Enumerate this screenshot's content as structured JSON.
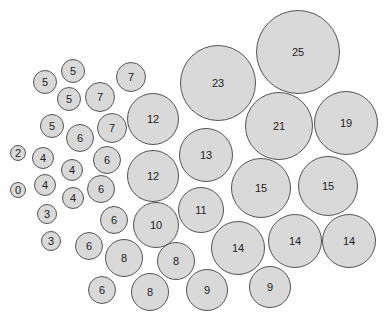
{
  "chart_data": {
    "type": "bubble",
    "title": "",
    "xlabel": "",
    "ylabel": "",
    "grid": false,
    "legend": null,
    "fill_color": "#d9d9d9",
    "stroke_color": "#555555",
    "text_color": "#222222",
    "bubbles": [
      {
        "label": "25",
        "value": 25,
        "cx": 298,
        "cy": 52,
        "r": 42
      },
      {
        "label": "23",
        "value": 23,
        "cx": 218,
        "cy": 83,
        "r": 38
      },
      {
        "label": "21",
        "value": 21,
        "cx": 279,
        "cy": 126,
        "r": 34
      },
      {
        "label": "19",
        "value": 19,
        "cx": 346,
        "cy": 123,
        "r": 32
      },
      {
        "label": "12",
        "value": 12,
        "cx": 153,
        "cy": 119,
        "r": 26
      },
      {
        "label": "13",
        "value": 13,
        "cx": 206,
        "cy": 155,
        "r": 27
      },
      {
        "label": "12",
        "value": 12,
        "cx": 153,
        "cy": 176,
        "r": 26
      },
      {
        "label": "15",
        "value": 15,
        "cx": 261,
        "cy": 188,
        "r": 30
      },
      {
        "label": "15",
        "value": 15,
        "cx": 328,
        "cy": 186,
        "r": 30
      },
      {
        "label": "11",
        "value": 11,
        "cx": 201,
        "cy": 210,
        "r": 23
      },
      {
        "label": "10",
        "value": 10,
        "cx": 156,
        "cy": 225,
        "r": 23
      },
      {
        "label": "14",
        "value": 14,
        "cx": 238,
        "cy": 248,
        "r": 27
      },
      {
        "label": "14",
        "value": 14,
        "cx": 295,
        "cy": 241,
        "r": 27
      },
      {
        "label": "14",
        "value": 14,
        "cx": 349,
        "cy": 241,
        "r": 27
      },
      {
        "label": "8",
        "value": 8,
        "cx": 176,
        "cy": 261,
        "r": 19
      },
      {
        "label": "9",
        "value": 9,
        "cx": 207,
        "cy": 290,
        "r": 21
      },
      {
        "label": "9",
        "value": 9,
        "cx": 270,
        "cy": 287,
        "r": 21
      },
      {
        "label": "8",
        "value": 8,
        "cx": 150,
        "cy": 292,
        "r": 19
      },
      {
        "label": "8",
        "value": 8,
        "cx": 124,
        "cy": 258,
        "r": 19
      },
      {
        "label": "6",
        "value": 6,
        "cx": 102,
        "cy": 290,
        "r": 14
      },
      {
        "label": "6",
        "value": 6,
        "cx": 89,
        "cy": 246,
        "r": 14
      },
      {
        "label": "6",
        "value": 6,
        "cx": 114,
        "cy": 220,
        "r": 14
      },
      {
        "label": "6",
        "value": 6,
        "cx": 101,
        "cy": 189,
        "r": 14
      },
      {
        "label": "6",
        "value": 6,
        "cx": 107,
        "cy": 160,
        "r": 14
      },
      {
        "label": "6",
        "value": 6,
        "cx": 80,
        "cy": 138,
        "r": 14
      },
      {
        "label": "7",
        "value": 7,
        "cx": 131,
        "cy": 77,
        "r": 15
      },
      {
        "label": "7",
        "value": 7,
        "cx": 100,
        "cy": 97,
        "r": 15
      },
      {
        "label": "7",
        "value": 7,
        "cx": 112,
        "cy": 128,
        "r": 15
      },
      {
        "label": "5",
        "value": 5,
        "cx": 73,
        "cy": 71,
        "r": 12
      },
      {
        "label": "5",
        "value": 5,
        "cx": 45,
        "cy": 82,
        "r": 12
      },
      {
        "label": "5",
        "value": 5,
        "cx": 69,
        "cy": 99,
        "r": 12
      },
      {
        "label": "5",
        "value": 5,
        "cx": 52,
        "cy": 126,
        "r": 12
      },
      {
        "label": "4",
        "value": 4,
        "cx": 43,
        "cy": 158,
        "r": 11
      },
      {
        "label": "4",
        "value": 4,
        "cx": 72,
        "cy": 170,
        "r": 11
      },
      {
        "label": "4",
        "value": 4,
        "cx": 45,
        "cy": 185,
        "r": 11
      },
      {
        "label": "4",
        "value": 4,
        "cx": 73,
        "cy": 198,
        "r": 11
      },
      {
        "label": "3",
        "value": 3,
        "cx": 47,
        "cy": 214,
        "r": 10
      },
      {
        "label": "3",
        "value": 3,
        "cx": 51,
        "cy": 241,
        "r": 10
      },
      {
        "label": "2",
        "value": 2,
        "cx": 18,
        "cy": 153,
        "r": 8
      },
      {
        "label": "0",
        "value": 0,
        "cx": 18,
        "cy": 190,
        "r": 8
      }
    ]
  }
}
